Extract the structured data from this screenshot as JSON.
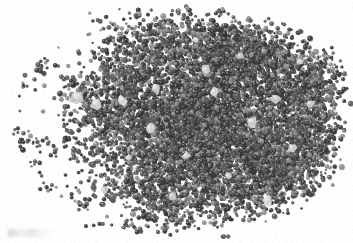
{
  "figure": {
    "kind": "grayscale-micrograph",
    "background_color": "#ffffff",
    "width_px": 353,
    "height_px": 243,
    "caption": "",
    "artifact_note": ""
  },
  "chart_data": {
    "type": "scatter",
    "title": "",
    "subtitle": "",
    "xlabel": "",
    "ylabel": "",
    "grid": false,
    "legend": null,
    "axis_visible": false,
    "tick_labels_x": [],
    "tick_labels_y": [],
    "xlim": [
      0,
      353
    ],
    "ylim": [
      0,
      243
    ],
    "palette": {
      "background": "#ffffff",
      "particle_dark": "#3a3a3a",
      "particle_mid": "#5c5c5c",
      "particle_light": "#8e8e8e",
      "inclusion_bright": "#e6e6e6",
      "inclusion_mid": "#c2c2c2",
      "shadow": "#262626"
    },
    "mass": {
      "center_x": 196,
      "center_y": 120,
      "radius_x": 152,
      "radius_y": 104,
      "core_center_x": 212,
      "core_center_y": 118,
      "core_radius_x": 118,
      "core_radius_y": 88,
      "edge_sharpness_right": 0.86,
      "edge_sharpness_left": 0.18
    },
    "particles": {
      "approx_count": 9000,
      "diameter_min_px": 2.2,
      "diameter_max_px": 5.6,
      "diameter_mean_px": 3.6,
      "shape": "circular",
      "density_core": 1.0,
      "density_left_tail": 0.12
    },
    "voids": [
      {
        "cx": 66,
        "cy": 40,
        "rx": 30,
        "ry": 26,
        "label": "upper-left-void"
      },
      {
        "cx": 34,
        "cy": 108,
        "rx": 22,
        "ry": 30,
        "label": "left-margin-void"
      },
      {
        "cx": 112,
        "cy": 212,
        "rx": 26,
        "ry": 18,
        "label": "lower-left-void"
      }
    ],
    "inclusions": [
      {
        "cx": 78,
        "cy": 98,
        "r": 9.0,
        "tone": "#cfcfcf"
      },
      {
        "cx": 96,
        "cy": 104,
        "r": 5.5,
        "tone": "#d8d8d8"
      },
      {
        "cx": 122,
        "cy": 100,
        "r": 6.0,
        "tone": "#e0e0e0"
      },
      {
        "cx": 156,
        "cy": 88,
        "r": 6.5,
        "tone": "#d2d2d2"
      },
      {
        "cx": 150,
        "cy": 128,
        "r": 5.0,
        "tone": "#dcdcdc"
      },
      {
        "cx": 206,
        "cy": 70,
        "r": 5.2,
        "tone": "#d5d5d5"
      },
      {
        "cx": 214,
        "cy": 92,
        "r": 4.6,
        "tone": "#e2e2e2"
      },
      {
        "cx": 240,
        "cy": 56,
        "r": 4.4,
        "tone": "#cccccc"
      },
      {
        "cx": 252,
        "cy": 122,
        "r": 5.8,
        "tone": "#dadada"
      },
      {
        "cx": 276,
        "cy": 98,
        "r": 5.0,
        "tone": "#d0d0d0"
      },
      {
        "cx": 268,
        "cy": 200,
        "r": 6.4,
        "tone": "#dedede"
      },
      {
        "cx": 292,
        "cy": 148,
        "r": 4.8,
        "tone": "#d6d6d6"
      },
      {
        "cx": 310,
        "cy": 104,
        "r": 4.2,
        "tone": "#cfcfcf"
      },
      {
        "cx": 186,
        "cy": 156,
        "r": 4.6,
        "tone": "#d4d4d4"
      },
      {
        "cx": 128,
        "cy": 158,
        "r": 4.0,
        "tone": "#dcdcdc"
      },
      {
        "cx": 172,
        "cy": 196,
        "r": 4.4,
        "tone": "#d2d2d2"
      },
      {
        "cx": 228,
        "cy": 176,
        "r": 4.0,
        "tone": "#d8d8d8"
      },
      {
        "cx": 300,
        "cy": 62,
        "r": 3.8,
        "tone": "#d6d6d6"
      },
      {
        "cx": 104,
        "cy": 190,
        "r": 4.2,
        "tone": "#cbcbcb"
      },
      {
        "cx": 196,
        "cy": 40,
        "r": 3.6,
        "tone": "#dddddd"
      }
    ]
  }
}
